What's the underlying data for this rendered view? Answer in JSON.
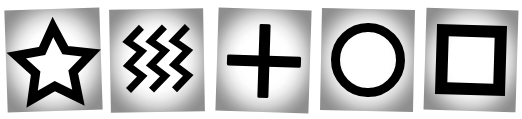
{
  "scene": {
    "title": "Zener ESP symbol cards",
    "background_color": "#ffffff",
    "card_count": 5,
    "card_face_color": "#ffffff",
    "card_edge_color": "#8e8e8e",
    "symbol_color": "#000000"
  },
  "cards": [
    {
      "index": 1,
      "symbol_name": "star-icon",
      "label": "Star",
      "stroke_width": 9,
      "rotation_deg": -1.9
    },
    {
      "index": 2,
      "symbol_name": "waves-icon",
      "label": "Waves",
      "stroke_width": 7,
      "wave_count": 3,
      "rotation_deg": -1.0
    },
    {
      "index": 3,
      "symbol_name": "cross-icon",
      "label": "Cross",
      "stroke_width": 9,
      "rotation_deg": 1.8
    },
    {
      "index": 4,
      "symbol_name": "circle-icon",
      "label": "Circle",
      "stroke_width": 9,
      "rotation_deg": 1.1
    },
    {
      "index": 5,
      "symbol_name": "square-icon",
      "label": "Square",
      "stroke_width": 12,
      "rotation_deg": 1.7
    }
  ]
}
